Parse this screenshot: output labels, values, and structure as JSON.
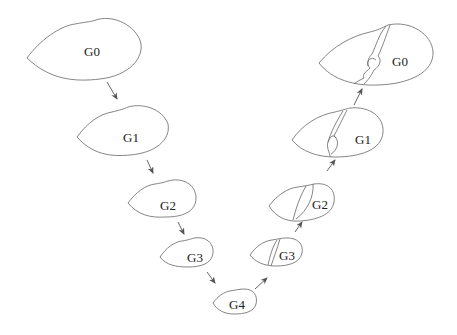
{
  "diagram": {
    "coarsening_phase": {
      "levels": [
        {
          "label": "G0"
        },
        {
          "label": "G1"
        },
        {
          "label": "G2"
        },
        {
          "label": "G3"
        }
      ]
    },
    "coarsest": {
      "label": "G4"
    },
    "uncoarsening_phase": {
      "levels": [
        {
          "label": "G3"
        },
        {
          "label": "G2"
        },
        {
          "label": "G1"
        },
        {
          "label": "G0"
        }
      ]
    },
    "colors": {
      "outline": "#777777",
      "arrow": "#555555",
      "text": "#222222",
      "background": "#ffffff"
    }
  }
}
